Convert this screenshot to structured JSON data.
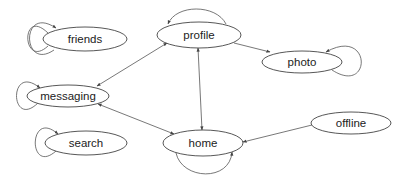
{
  "diagram": {
    "type": "state-graph",
    "stroke_color": "#555555",
    "background": "#ffffff",
    "nodes": [
      {
        "id": "friends",
        "label": "friends",
        "cx": 85,
        "cy": 39,
        "rx": 42,
        "ry": 12,
        "self_loop": "left"
      },
      {
        "id": "profile",
        "label": "profile",
        "cx": 199,
        "cy": 35,
        "rx": 42,
        "ry": 13,
        "self_loop": "top"
      },
      {
        "id": "photo",
        "label": "photo",
        "cx": 302,
        "cy": 62,
        "rx": 40,
        "ry": 11,
        "self_loop": "right"
      },
      {
        "id": "messaging",
        "label": "messaging",
        "cx": 68,
        "cy": 96,
        "rx": 41,
        "ry": 11,
        "self_loop": "left"
      },
      {
        "id": "search",
        "label": "search",
        "cx": 86,
        "cy": 143,
        "rx": 41,
        "ry": 12,
        "self_loop": "left"
      },
      {
        "id": "home",
        "label": "home",
        "cx": 203,
        "cy": 143,
        "rx": 40,
        "ry": 13,
        "self_loop": "bottom"
      },
      {
        "id": "offline",
        "label": "offline",
        "cx": 351,
        "cy": 123,
        "rx": 40,
        "ry": 11,
        "self_loop": null
      }
    ],
    "edges": [
      {
        "from": "messaging",
        "to": "profile",
        "bidirectional": true
      },
      {
        "from": "profile",
        "to": "photo",
        "bidirectional": false
      },
      {
        "from": "profile",
        "to": "home",
        "bidirectional": true
      },
      {
        "from": "messaging",
        "to": "home",
        "bidirectional": true
      },
      {
        "from": "offline",
        "to": "home",
        "bidirectional": false
      }
    ]
  }
}
